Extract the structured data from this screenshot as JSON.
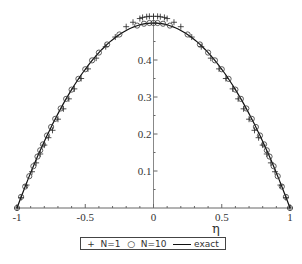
{
  "chart_data": {
    "type": "line",
    "title": "",
    "xlabel": "η",
    "ylabel": "",
    "xlim": [
      -1,
      1
    ],
    "ylim": [
      0,
      0.52
    ],
    "x_ticks": [
      -1,
      -0.5,
      0,
      0.5,
      1
    ],
    "x_tick_labels": [
      "-1",
      "-0.5",
      "0",
      "0.5",
      "1"
    ],
    "y_ticks": [
      0.1,
      0.2,
      0.3,
      0.4
    ],
    "y_tick_labels": [
      "0.1",
      "0.2",
      "0.3",
      "0.4"
    ],
    "grid": false,
    "legend_position": "bottom",
    "series": [
      {
        "name": "N=1",
        "marker": "+",
        "style": "markers",
        "x": [
          -1,
          -0.97,
          -0.93,
          -0.89,
          -0.86,
          -0.83,
          -0.8,
          -0.77,
          -0.74,
          -0.7,
          -0.66,
          -0.62,
          -0.58,
          -0.53,
          -0.48,
          -0.42,
          -0.35,
          -0.28,
          -0.2,
          -0.15,
          -0.1,
          -0.08,
          -0.05,
          -0.03,
          0,
          0.03,
          0.05,
          0.08,
          0.1,
          0.15,
          0.2,
          0.28,
          0.35,
          0.42,
          0.48,
          0.53,
          0.58,
          0.62,
          0.66,
          0.7,
          0.74,
          0.77,
          0.8,
          0.83,
          0.86,
          0.89,
          0.93,
          0.97,
          1
        ],
        "y": [
          0,
          0.028,
          0.062,
          0.098,
          0.122,
          0.146,
          0.17,
          0.19,
          0.21,
          0.24,
          0.268,
          0.295,
          0.322,
          0.35,
          0.376,
          0.405,
          0.436,
          0.462,
          0.49,
          0.502,
          0.512,
          0.515,
          0.517,
          0.518,
          0.518,
          0.518,
          0.517,
          0.515,
          0.512,
          0.502,
          0.49,
          0.462,
          0.436,
          0.405,
          0.376,
          0.35,
          0.322,
          0.295,
          0.268,
          0.24,
          0.21,
          0.19,
          0.17,
          0.146,
          0.122,
          0.098,
          0.062,
          0.028,
          0
        ]
      },
      {
        "name": "N=10",
        "marker": "o",
        "style": "markers",
        "x": [
          -1,
          -0.97,
          -0.94,
          -0.91,
          -0.88,
          -0.85,
          -0.83,
          -0.81,
          -0.78,
          -0.75,
          -0.72,
          -0.68,
          -0.64,
          -0.6,
          -0.55,
          -0.5,
          -0.45,
          -0.4,
          -0.34,
          -0.25,
          -0.12,
          -0.07,
          -0.03,
          0,
          0.03,
          0.07,
          0.12,
          0.25,
          0.34,
          0.4,
          0.45,
          0.5,
          0.55,
          0.6,
          0.64,
          0.68,
          0.72,
          0.75,
          0.78,
          0.81,
          0.83,
          0.85,
          0.88,
          0.91,
          0.94,
          0.97,
          1
        ],
        "y": [
          0,
          0.03,
          0.058,
          0.086,
          0.113,
          0.139,
          0.156,
          0.172,
          0.196,
          0.219,
          0.241,
          0.269,
          0.295,
          0.32,
          0.349,
          0.375,
          0.399,
          0.42,
          0.442,
          0.469,
          0.493,
          0.498,
          0.5,
          0.5,
          0.5,
          0.498,
          0.493,
          0.469,
          0.442,
          0.42,
          0.399,
          0.375,
          0.349,
          0.32,
          0.295,
          0.269,
          0.241,
          0.219,
          0.196,
          0.172,
          0.156,
          0.139,
          0.113,
          0.086,
          0.058,
          0.03,
          0
        ]
      },
      {
        "name": "exact",
        "marker": "",
        "style": "line",
        "formula": "0.5*(1-η^2)",
        "x": [
          -1,
          -0.9,
          -0.8,
          -0.7,
          -0.6,
          -0.5,
          -0.4,
          -0.3,
          -0.2,
          -0.1,
          0,
          0.1,
          0.2,
          0.3,
          0.4,
          0.5,
          0.6,
          0.7,
          0.8,
          0.9,
          1
        ],
        "y": [
          0,
          0.095,
          0.18,
          0.255,
          0.32,
          0.375,
          0.42,
          0.455,
          0.48,
          0.495,
          0.5,
          0.495,
          0.48,
          0.455,
          0.42,
          0.375,
          0.32,
          0.255,
          0.18,
          0.095,
          0
        ]
      }
    ]
  },
  "legend": {
    "n1_symbol": "+",
    "n1_label": "N=1",
    "n10_symbol": "○",
    "n10_label": "N=10",
    "exact_label": "exact"
  }
}
